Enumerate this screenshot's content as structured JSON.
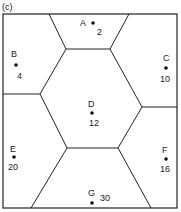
{
  "figure": {
    "panel_label": "(c)",
    "regions": [
      {
        "name": "A",
        "value": "2"
      },
      {
        "name": "B",
        "value": "4"
      },
      {
        "name": "C",
        "value": "10"
      },
      {
        "name": "D",
        "value": "12"
      },
      {
        "name": "E",
        "value": "20"
      },
      {
        "name": "F",
        "value": "16"
      },
      {
        "name": "G",
        "value": "30"
      }
    ]
  }
}
